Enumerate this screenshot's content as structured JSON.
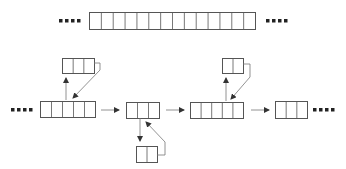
{
  "diagram": {
    "stroke_color": "#555555",
    "top_array": {
      "cells": 14,
      "x": 89,
      "y": 12,
      "w": 166,
      "h": 17
    },
    "ellipsis": "....",
    "nodes": [
      {
        "id": "node-1",
        "cells": 5,
        "x": 40,
        "y": 101,
        "w": 55,
        "h": 16
      },
      {
        "id": "node-2",
        "cells": 3,
        "x": 126,
        "y": 102,
        "w": 33,
        "h": 16
      },
      {
        "id": "node-3",
        "cells": 5,
        "x": 190,
        "y": 102,
        "w": 53,
        "h": 16
      },
      {
        "id": "node-4",
        "cells": 3,
        "x": 275,
        "y": 101,
        "w": 32,
        "h": 17
      }
    ],
    "children": [
      {
        "id": "child-1",
        "parent": "node-1",
        "cells": 3,
        "x": 62,
        "y": 58,
        "w": 32,
        "h": 15
      },
      {
        "id": "child-2",
        "parent": "node-2",
        "cells": 2,
        "x": 136,
        "y": 146,
        "w": 21,
        "h": 16
      },
      {
        "id": "child-3",
        "parent": "node-3",
        "cells": 2,
        "x": 222,
        "y": 58,
        "w": 21,
        "h": 15
      }
    ]
  }
}
